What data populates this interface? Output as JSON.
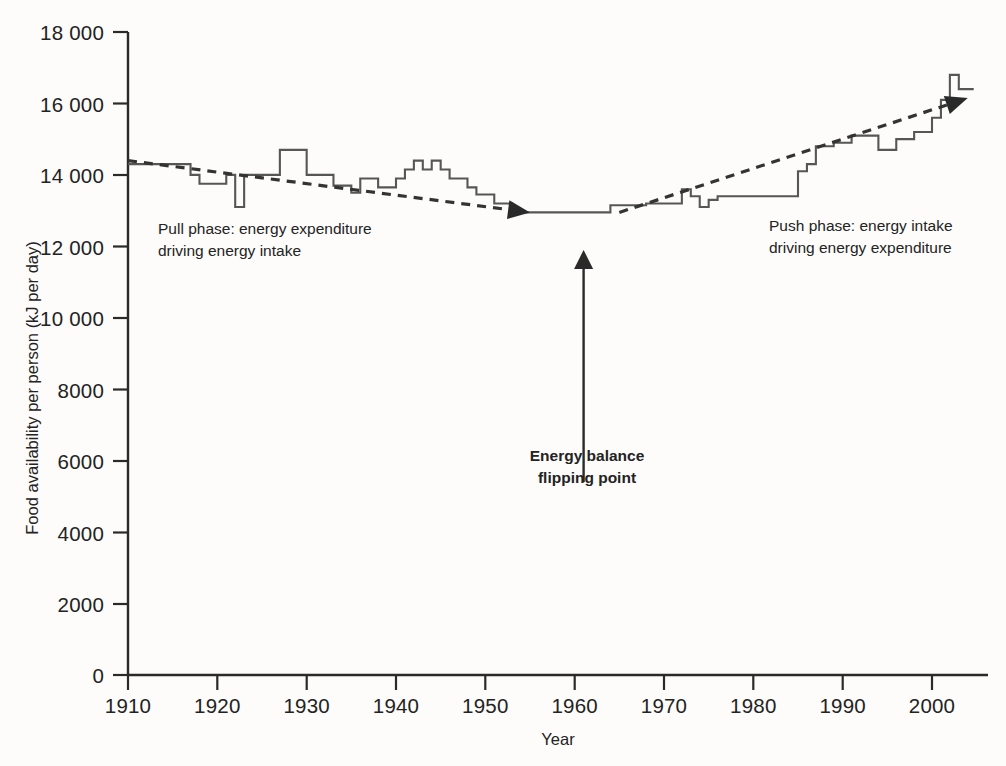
{
  "chart_data": {
    "type": "line",
    "title": "",
    "xlabel": "Year",
    "ylabel": "Food availability per person (kJ per day)",
    "xlim": [
      1910,
      2005
    ],
    "ylim": [
      0,
      18000
    ],
    "grid": false,
    "legend_position": "none",
    "x_ticks": [
      "1910",
      "1920",
      "1930",
      "1940",
      "1950",
      "1960",
      "1970",
      "1980",
      "1990",
      "2000"
    ],
    "y_ticks": [
      "0",
      "2000",
      "4000",
      "6000",
      "8000",
      "10 000",
      "12 000",
      "14 000",
      "16 000",
      "18 000"
    ],
    "series": [
      {
        "name": "Food availability per person",
        "style": "solid",
        "color": "#565656",
        "x": [
          1910,
          1911,
          1912,
          1913,
          1914,
          1915,
          1916,
          1917,
          1918,
          1919,
          1920,
          1921,
          1922,
          1923,
          1924,
          1925,
          1926,
          1927,
          1928,
          1929,
          1930,
          1931,
          1932,
          1933,
          1934,
          1935,
          1936,
          1937,
          1938,
          1939,
          1940,
          1941,
          1942,
          1943,
          1944,
          1945,
          1946,
          1947,
          1948,
          1949,
          1950,
          1951,
          1952,
          1953,
          1954,
          1955,
          1956,
          1957,
          1958,
          1959,
          1960,
          1961,
          1962,
          1963,
          1964,
          1965,
          1966,
          1967,
          1968,
          1969,
          1970,
          1971,
          1972,
          1973,
          1974,
          1975,
          1976,
          1977,
          1978,
          1979,
          1980,
          1981,
          1982,
          1983,
          1984,
          1985,
          1986,
          1987,
          1988,
          1989,
          1990,
          1991,
          1992,
          1993,
          1994,
          1995,
          1996,
          1997,
          1998,
          1999,
          2000,
          2001,
          2002,
          2003,
          2004
        ],
        "y": [
          14300,
          14300,
          14300,
          14300,
          14300,
          14300,
          14300,
          14000,
          13750,
          13750,
          13750,
          14000,
          13100,
          14000,
          14000,
          14000,
          14000,
          14700,
          14700,
          14700,
          14000,
          14000,
          14000,
          13700,
          13700,
          13500,
          13900,
          13900,
          13650,
          13650,
          13900,
          14150,
          14400,
          14150,
          14400,
          14150,
          13900,
          13900,
          13650,
          13450,
          13450,
          13200,
          13200,
          12950,
          12950,
          12950,
          12950,
          12950,
          12950,
          12950,
          12950,
          12950,
          12950,
          12950,
          13150,
          13150,
          13150,
          13150,
          13200,
          13200,
          13200,
          13200,
          13600,
          13400,
          13100,
          13300,
          13400,
          13400,
          13400,
          13400,
          13400,
          13400,
          13400,
          13400,
          13400,
          14100,
          14300,
          14800,
          14800,
          14900,
          14900,
          15100,
          15100,
          15100,
          14700,
          14700,
          15000,
          15000,
          15200,
          15200,
          15600,
          16100,
          16800,
          16400,
          16400
        ]
      },
      {
        "name": "Pull phase trend",
        "style": "dashed-arrow",
        "color": "#333333",
        "x": [
          1910,
          1955
        ],
        "y": [
          14400,
          12950
        ]
      },
      {
        "name": "Push phase trend",
        "style": "dashed-arrow",
        "color": "#333333",
        "x": [
          1965,
          2004
        ],
        "y": [
          12950,
          16150
        ]
      }
    ],
    "annotations": [
      {
        "name": "pull-phase-label",
        "lines": [
          "Pull phase: energy expenditure",
          "driving energy intake"
        ],
        "bold": false,
        "x": 1913,
        "y": 12150
      },
      {
        "name": "push-phase-label",
        "lines": [
          "Push phase: energy intake",
          "driving energy expenditure"
        ],
        "bold": false,
        "x": 1980,
        "y": 12150
      },
      {
        "name": "flipping-point-label",
        "lines": [
          "Energy balance",
          "flipping point"
        ],
        "bold": true,
        "x": 1961,
        "y": 6000,
        "arrow": {
          "from_year": 1961,
          "from_value": 5400,
          "to_value": 11900
        }
      }
    ]
  },
  "axes": {
    "x_label": "Year",
    "y_label": "Food availability per person (kJ per day)"
  },
  "colors": {
    "background": "#fdfcfa",
    "axis": "#2a2a2a",
    "data_line": "#565656",
    "trend_line": "#333333",
    "text": "#232323"
  }
}
